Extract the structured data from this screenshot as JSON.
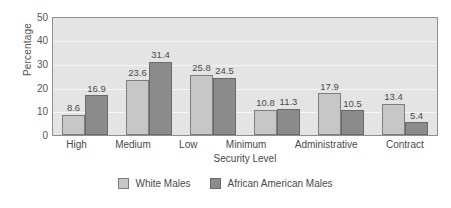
{
  "chart_data": {
    "type": "bar",
    "title": "",
    "xlabel": "Security Level",
    "ylabel": "Percentage",
    "categories": [
      "High",
      "Medium",
      "Low",
      "Minimum",
      "Administrative",
      "Contract"
    ],
    "series": [
      {
        "name": "White Males",
        "color": "#c7c7c7",
        "values": [
          8.6,
          23.6,
          25.8,
          10.8,
          17.9,
          13.4
        ]
      },
      {
        "name": "African American Males",
        "color": "#8b8b8b",
        "values": [
          16.9,
          31.4,
          24.5,
          11.3,
          10.5,
          5.4
        ]
      }
    ],
    "ylim": [
      0,
      50
    ],
    "yticks": [
      50,
      40,
      30,
      20,
      10,
      0
    ],
    "grid": true,
    "legend_position": "bottom",
    "data_labels": true,
    "plot_background": "#e4e4e4",
    "gridline_color": "#f6f6f6"
  }
}
